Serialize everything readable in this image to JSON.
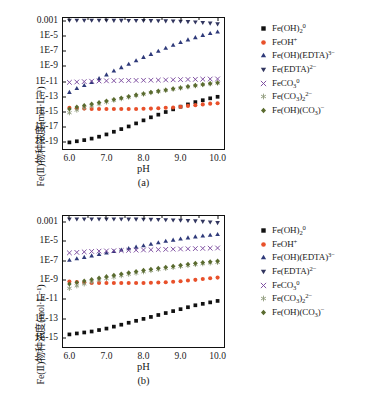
{
  "figure": {
    "ylabel": "Fe(Ⅱ)物种浓度(mol·L⁻¹)",
    "xlabel": "pH",
    "panel_a_tag": "(a)",
    "panel_b_tag": "(b)"
  },
  "colors": {
    "fe_oh_2": "#111111",
    "feoh_plus": "#e8502a",
    "fe_oh_edta": "#2f3a7a",
    "fe_edta": "#32365f",
    "feco3": "#7a4a9e",
    "fe_co3_2": "#8f9a7a",
    "fe_oh_co3": "#5a6b2f",
    "axis": "#111111"
  },
  "legend": [
    {
      "marker": "square-marker",
      "key": "fe_oh_2",
      "label": "Fe(OH)",
      "sub": "2",
      "sup": "0"
    },
    {
      "marker": "circle-marker",
      "key": "feoh_plus",
      "label": "FeOH",
      "sub": "",
      "sup": "+"
    },
    {
      "marker": "triangle-up-marker",
      "key": "fe_oh_edta",
      "label": "Fe(OH)(EDTA)",
      "sub": "",
      "sup": "3−"
    },
    {
      "marker": "triangle-down-marker",
      "key": "fe_edta",
      "label": "Fe(EDTA)",
      "sub": "",
      "sup": "2−"
    },
    {
      "marker": "cross-marker",
      "key": "feco3",
      "label": "FeCO",
      "sub": "3",
      "sup": "0"
    },
    {
      "marker": "asterisk-marker",
      "key": "fe_co3_2",
      "label": "Fe(CO",
      "sub": "3",
      "sup": "",
      "label2": ")",
      "sub2": "2",
      "sup2": "2−"
    },
    {
      "marker": "diamond-marker",
      "key": "fe_oh_co3",
      "label": "Fe(OH)(CO",
      "sub": "3",
      "sup": "",
      "label2": ")",
      "sup2": "−"
    }
  ],
  "chart_data": [
    {
      "type": "scatter",
      "panel": "(a)",
      "title": "",
      "xlabel": "pH",
      "ylabel": "Fe(Ⅱ)物种浓度(mol·L⁻¹)",
      "xlim": [
        5.8,
        10.2
      ],
      "xticks": [
        6.0,
        7.0,
        8.0,
        9.0,
        10.0
      ],
      "xticklabels": [
        "6.0",
        "7.0",
        "8.0",
        "9.0",
        "10.0"
      ],
      "ylim_log": [
        -20,
        -2.5
      ],
      "yticks_log": [
        -3,
        -5,
        -7,
        -9,
        -11,
        -13,
        -15,
        -17,
        -19
      ],
      "yticklabels": [
        "0.001",
        "1E-5",
        "1E-7",
        "1E-9",
        "1E-11",
        "1E-13",
        "1E-15",
        "1E-17",
        "1E-19"
      ],
      "grid": false,
      "legend_position": "right-outside",
      "x": [
        6.0,
        6.2,
        6.4,
        6.6,
        6.8,
        7.0,
        7.2,
        7.4,
        7.6,
        7.8,
        8.0,
        8.2,
        8.4,
        8.6,
        8.8,
        9.0,
        9.2,
        9.4,
        9.6,
        9.8,
        10.0
      ],
      "series": [
        {
          "name": "Fe(OH)2(0)",
          "key": "fe_oh_2",
          "marker": "square-marker",
          "values_log": [
            -19.0,
            -18.85,
            -18.7,
            -18.5,
            -18.25,
            -17.95,
            -17.6,
            -17.25,
            -16.9,
            -16.5,
            -16.1,
            -15.7,
            -15.35,
            -15.0,
            -14.65,
            -14.3,
            -14.0,
            -13.7,
            -13.45,
            -13.2,
            -13.0
          ]
        },
        {
          "name": "FeOH(+)",
          "key": "feoh_plus",
          "marker": "circle-marker",
          "values_log": [
            -14.45,
            -14.5,
            -14.55,
            -14.6,
            -14.6,
            -14.6,
            -14.6,
            -14.6,
            -14.6,
            -14.6,
            -14.58,
            -14.55,
            -14.5,
            -14.45,
            -14.4,
            -14.3,
            -14.2,
            -14.1,
            -14.0,
            -13.9,
            -13.85
          ]
        },
        {
          "name": "Fe(OH)(EDTA)(3-)",
          "key": "fe_oh_edta",
          "marker": "triangle-up-marker",
          "values_log": [
            -12.4,
            -11.9,
            -11.5,
            -11.1,
            -10.6,
            -10.1,
            -9.6,
            -9.15,
            -8.7,
            -8.25,
            -7.8,
            -7.4,
            -7.0,
            -6.6,
            -6.2,
            -5.85,
            -5.5,
            -5.2,
            -4.9,
            -4.65,
            -4.45
          ]
        },
        {
          "name": "Fe(EDTA)(2-)",
          "key": "fe_edta",
          "marker": "triangle-down-marker",
          "values_log": [
            -2.95,
            -2.95,
            -2.95,
            -2.95,
            -2.95,
            -2.95,
            -2.96,
            -2.96,
            -2.97,
            -2.97,
            -2.98,
            -2.99,
            -3.0,
            -3.02,
            -3.05,
            -3.08,
            -3.12,
            -3.17,
            -3.24,
            -3.32,
            -3.42
          ]
        },
        {
          "name": "FeCO3(0)",
          "key": "feco3",
          "marker": "cross-marker",
          "values_log": [
            -11.1,
            -11.05,
            -11.0,
            -10.95,
            -10.92,
            -10.9,
            -10.88,
            -10.86,
            -10.85,
            -10.84,
            -10.83,
            -10.82,
            -10.8,
            -10.78,
            -10.76,
            -10.74,
            -10.72,
            -10.7,
            -10.68,
            -10.66,
            -10.65
          ]
        },
        {
          "name": "Fe(CO3)2(2-)",
          "key": "fe_co3_2",
          "marker": "asterisk-marker",
          "values_log": [
            -15.1,
            -14.75,
            -14.45,
            -14.2,
            -13.95,
            -13.7,
            -13.45,
            -13.25,
            -13.05,
            -12.85,
            -12.65,
            -12.45,
            -12.3,
            -12.15,
            -12.0,
            -11.85,
            -11.7,
            -11.55,
            -11.4,
            -11.3,
            -11.2
          ]
        },
        {
          "name": "Fe(OH)(CO3)(-)",
          "key": "fe_oh_co3",
          "marker": "diamond-marker",
          "values_log": [
            -14.6,
            -14.35,
            -14.15,
            -13.95,
            -13.75,
            -13.55,
            -13.35,
            -13.15,
            -12.95,
            -12.75,
            -12.6,
            -12.4,
            -12.25,
            -12.1,
            -11.95,
            -11.8,
            -11.65,
            -11.5,
            -11.38,
            -11.25,
            -11.15
          ]
        }
      ]
    },
    {
      "type": "scatter",
      "panel": "(b)",
      "title": "",
      "xlabel": "pH",
      "ylabel": "Fe(Ⅱ)物种浓度(mol·L⁻¹)",
      "xlim": [
        5.8,
        10.2
      ],
      "xticks": [
        6.0,
        7.0,
        8.0,
        9.0,
        10.0
      ],
      "xticklabels": [
        "6.0",
        "7.0",
        "8.0",
        "9.0",
        "10.0"
      ],
      "ylim_log": [
        -16,
        -2.3
      ],
      "yticks_log": [
        -3,
        -5,
        -7,
        -9,
        -11,
        -13,
        -15
      ],
      "yticklabels": [
        "0.001",
        "1E-5",
        "1E-7",
        "1E-9",
        "1E-11",
        "1E-13",
        "1E-15"
      ],
      "grid": false,
      "legend_position": "right-outside",
      "x": [
        6.0,
        6.2,
        6.4,
        6.6,
        6.8,
        7.0,
        7.2,
        7.4,
        7.6,
        7.8,
        8.0,
        8.2,
        8.4,
        8.6,
        8.8,
        9.0,
        9.2,
        9.4,
        9.6,
        9.8,
        10.0
      ],
      "series": [
        {
          "name": "Fe(OH)2(0)",
          "key": "fe_oh_2",
          "marker": "square-marker",
          "values_log": [
            -14.6,
            -14.5,
            -14.4,
            -14.3,
            -14.15,
            -14.0,
            -13.8,
            -13.6,
            -13.4,
            -13.2,
            -13.0,
            -12.8,
            -12.6,
            -12.4,
            -12.2,
            -12.0,
            -11.8,
            -11.6,
            -11.45,
            -11.3,
            -11.15
          ]
        },
        {
          "name": "FeOH(+)",
          "key": "feoh_plus",
          "marker": "circle-marker",
          "values_log": [
            -9.15,
            -9.2,
            -9.25,
            -9.3,
            -9.3,
            -9.3,
            -9.3,
            -9.3,
            -9.3,
            -9.3,
            -9.3,
            -9.28,
            -9.25,
            -9.22,
            -9.18,
            -9.12,
            -9.05,
            -8.98,
            -8.9,
            -8.82,
            -8.75
          ]
        },
        {
          "name": "Fe(OH)(EDTA)(3-)",
          "key": "fe_oh_edta",
          "marker": "triangle-up-marker",
          "values_log": [
            -6.95,
            -6.8,
            -6.65,
            -6.5,
            -6.35,
            -6.2,
            -6.05,
            -5.9,
            -5.75,
            -5.6,
            -5.45,
            -5.3,
            -5.15,
            -5.0,
            -4.88,
            -4.76,
            -4.64,
            -4.54,
            -4.45,
            -4.37,
            -4.3
          ]
        },
        {
          "name": "Fe(EDTA)(2-)",
          "key": "fe_edta",
          "marker": "triangle-down-marker",
          "values_log": [
            -2.72,
            -2.72,
            -2.72,
            -2.72,
            -2.72,
            -2.72,
            -2.73,
            -2.73,
            -2.74,
            -2.74,
            -2.75,
            -2.76,
            -2.78,
            -2.8,
            -2.82,
            -2.85,
            -2.88,
            -2.92,
            -2.97,
            -3.03,
            -3.1
          ]
        },
        {
          "name": "FeCO3(0)",
          "key": "feco3",
          "marker": "cross-marker",
          "values_log": [
            -6.2,
            -6.15,
            -6.1,
            -6.05,
            -6.02,
            -6.0,
            -5.98,
            -5.96,
            -5.94,
            -5.92,
            -5.9,
            -5.88,
            -5.86,
            -5.84,
            -5.82,
            -5.8,
            -5.78,
            -5.76,
            -5.74,
            -5.72,
            -5.7
          ]
        },
        {
          "name": "Fe(CO3)2(2-)",
          "key": "fe_co3_2",
          "marker": "asterisk-marker",
          "values_log": [
            -9.85,
            -9.6,
            -9.4,
            -9.2,
            -9.0,
            -8.85,
            -8.7,
            -8.55,
            -8.4,
            -8.28,
            -8.15,
            -8.02,
            -7.9,
            -7.8,
            -7.7,
            -7.6,
            -7.5,
            -7.4,
            -7.32,
            -7.24,
            -7.18
          ]
        },
        {
          "name": "Fe(OH)(CO3)(-)",
          "key": "fe_oh_co3",
          "marker": "diamond-marker",
          "values_log": [
            -9.4,
            -9.25,
            -9.1,
            -8.95,
            -8.8,
            -8.65,
            -8.5,
            -8.38,
            -8.25,
            -8.12,
            -8.0,
            -7.88,
            -7.78,
            -7.68,
            -7.58,
            -7.48,
            -7.38,
            -7.28,
            -7.2,
            -7.12,
            -7.05
          ]
        }
      ]
    }
  ]
}
